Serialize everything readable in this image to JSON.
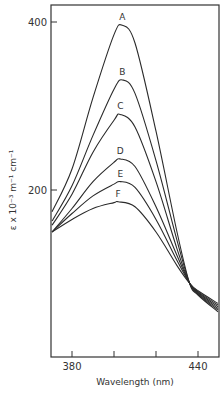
{
  "chart_data": {
    "type": "line",
    "title": "",
    "xlabel": "Wavelength (nm)",
    "ylabel": "ε x 10⁻³ m⁻¹ cm⁻¹",
    "xlim": [
      370,
      450
    ],
    "ylim": [
      0,
      420
    ],
    "x_ticks": [
      380,
      400,
      420,
      440
    ],
    "x_tick_labels": [
      "380",
      "",
      "",
      "440"
    ],
    "y_ticks": [
      200,
      400
    ],
    "y_tick_labels": [
      "200",
      "400"
    ],
    "grid": false,
    "legend": "none; curves labeled A–F directly above peaks",
    "isosbestic_point": {
      "wavelength": 436,
      "value": 89
    },
    "series": [
      {
        "name": "A",
        "x": [
          370,
          380,
          390,
          400,
          404,
          410,
          420,
          430,
          436,
          440,
          450
        ],
        "values": [
          174,
          225,
          310,
          385,
          396,
          375,
          270,
          150,
          89,
          75,
          55
        ]
      },
      {
        "name": "B",
        "x": [
          370,
          380,
          390,
          400,
          404,
          410,
          420,
          430,
          436,
          440,
          450
        ],
        "values": [
          163,
          205,
          265,
          320,
          331,
          315,
          235,
          140,
          89,
          76,
          57
        ]
      },
      {
        "name": "C",
        "x": [
          370,
          380,
          390,
          400,
          403,
          410,
          420,
          430,
          436,
          440,
          450
        ],
        "values": [
          158,
          195,
          245,
          283,
          290,
          275,
          210,
          130,
          89,
          77,
          59
        ]
      },
      {
        "name": "D",
        "x": [
          370,
          380,
          390,
          400,
          403,
          410,
          420,
          430,
          436,
          440,
          450
        ],
        "values": [
          150,
          178,
          210,
          233,
          237,
          228,
          180,
          122,
          89,
          78,
          61
        ]
      },
      {
        "name": "E",
        "x": [
          370,
          380,
          390,
          400,
          403,
          410,
          420,
          430,
          436,
          440,
          450
        ],
        "values": [
          150,
          172,
          193,
          207,
          210,
          203,
          165,
          116,
          89,
          79,
          63
        ]
      },
      {
        "name": "F",
        "x": [
          370,
          380,
          390,
          400,
          402,
          410,
          420,
          430,
          436,
          440,
          450
        ],
        "values": [
          150,
          165,
          178,
          185,
          186,
          180,
          150,
          110,
          89,
          80,
          65
        ]
      }
    ]
  }
}
